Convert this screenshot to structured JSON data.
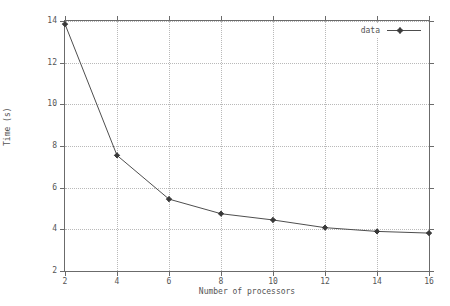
{
  "chart_data": {
    "type": "line",
    "title": "",
    "subtitle": "",
    "xlabel": "Number of processors",
    "ylabel": "Time (s)",
    "xlim": [
      2,
      16
    ],
    "ylim": [
      2,
      14
    ],
    "xticks": [
      "2",
      "4",
      "6",
      "8",
      "10",
      "12",
      "14",
      "16"
    ],
    "yticks": [
      "2",
      "4",
      "6",
      "8",
      "10",
      "12",
      "14"
    ],
    "grid": true,
    "legend_position": "top-right",
    "legend": [
      "data"
    ],
    "series": [
      {
        "name": "data",
        "x": [
          2,
          4,
          6,
          8,
          10,
          12,
          14,
          16
        ],
        "values": [
          13.85,
          7.55,
          5.45,
          4.75,
          4.45,
          4.08,
          3.9,
          3.82
        ],
        "color": "#4d4d4d",
        "marker": "diamond-plus"
      }
    ]
  },
  "legend": {
    "entry_label": "data",
    "sample_icon": "line-with-diamond-marker-icon"
  },
  "axes": {
    "x_title": "Number of processors",
    "y_title": "Time (s)"
  },
  "colors": {
    "line": "#4d4d4d",
    "grid": "#b9b9b9",
    "frame": "#6b6b6b",
    "text": "#555555",
    "background": "#ffffff"
  }
}
